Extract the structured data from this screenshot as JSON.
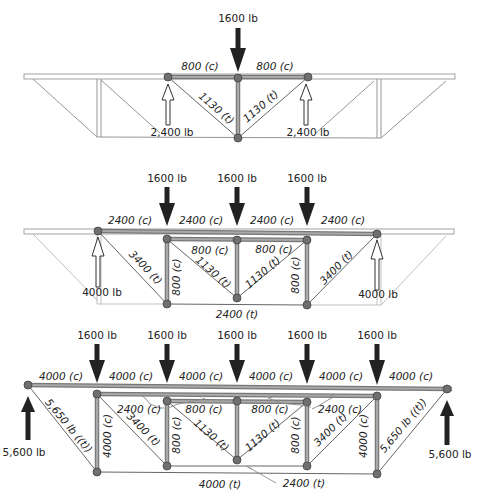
{
  "diagram_title": "",
  "colors": {
    "member_fill": "#a9a9a9",
    "member_edge": "#777777",
    "node": "#6f6f6f",
    "load_arrow": "#222222",
    "text": "#222222"
  },
  "panel1": {
    "load": "1600 lb",
    "top_left": "800 (c)",
    "top_right": "800 (c)",
    "diag_left": "1130 (t)",
    "diag_right": "1130 (t)",
    "reaction_left": "2,400 lb",
    "reaction_right": "2,400 lb"
  },
  "panel2": {
    "loads": [
      "1600 lb",
      "1600 lb",
      "1600 lb"
    ],
    "top_chord": [
      "2400 (c)",
      "2400 (c)",
      "2400 (c)",
      "2400 (c)"
    ],
    "inner_top_left": "800 (c)",
    "inner_top_right": "800 (c)",
    "diag_outer_left": "3400 (t)",
    "diag_outer_right": "3400 (t)",
    "diag_inner_left": "1130 (t)",
    "diag_inner_right": "1130 (t)",
    "vert_left": "800 (c)",
    "vert_right": "800 (c)",
    "bottom_chord": "2400 (t)",
    "reaction_left": "4000 lb",
    "reaction_right": "4000 lb"
  },
  "panel3": {
    "loads": [
      "1600 lb",
      "1600 lb",
      "1600 lb",
      "1600 lb",
      "1600 lb"
    ],
    "top_chord": [
      "4000 (c)",
      "4000 (c)",
      "4000 (c)",
      "4000 (c)",
      "4000 (c)",
      "4000 (c)"
    ],
    "second_chord_left": "2400 (c)",
    "second_chord_right": "2400 (c)",
    "inner_top_left": "800 (c)",
    "inner_top_right": "800 (c)",
    "diag_end_left": "5,650 lb ((t))",
    "diag_end_right": "5,650 lb ((t))",
    "diag_mid_left": "3400 (t)",
    "diag_mid_right": "3400 (t)",
    "diag_inner_left": "1130 (t)",
    "diag_inner_right": "1130 (t)",
    "vert_outer_left": "4000 (c)",
    "vert_outer_right": "4000 (c)",
    "vert_inner_left": "800 (c)",
    "vert_inner_right": "800 (c)",
    "bottom_chord_outer": "4000 (t)",
    "bottom_chord_inner": "2400 (t)",
    "reaction_left": "5,600 lb",
    "reaction_right": "5,600 lb"
  }
}
